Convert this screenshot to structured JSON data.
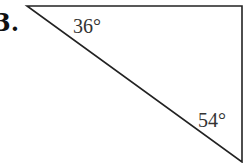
{
  "problem": {
    "number": "3."
  },
  "diagram": {
    "type": "right-triangle",
    "vertices": {
      "top_left": [
        27,
        6
      ],
      "top_right": [
        242,
        6
      ],
      "bottom_right": [
        242,
        162
      ]
    },
    "angles": [
      {
        "vertex": "top_left",
        "label": "36°"
      },
      {
        "vertex": "bottom_right",
        "label": "54°"
      }
    ],
    "stroke_color": "#222222"
  }
}
